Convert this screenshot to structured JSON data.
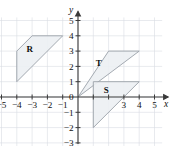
{
  "figure": {
    "type": "coordinate-plane",
    "axis_labels": {
      "x": "x",
      "y": "y"
    },
    "origin_label": "0"
  },
  "chart_data": {
    "type": "scatter",
    "title": "",
    "xlabel": "x",
    "ylabel": "y",
    "xlim": [
      -5.6,
      5.6
    ],
    "ylim": [
      -3.4,
      5.4
    ],
    "grid": true,
    "legend": "none",
    "x_ticks": [
      -5,
      -4,
      -3,
      -2,
      -1,
      0,
      1,
      2,
      3,
      4,
      5
    ],
    "y_ticks": [
      -3,
      -2,
      -1,
      0,
      1,
      2,
      3,
      4,
      5
    ],
    "x_tick_labels": [
      "−5",
      "−4",
      "−3",
      "−2",
      "−1",
      "0",
      "",
      "",
      "3",
      "4",
      "5"
    ],
    "y_tick_labels": [
      "−3",
      "−2",
      "−1",
      "0",
      "1",
      "2",
      "3",
      "4",
      "5"
    ],
    "shapes": [
      {
        "name": "R",
        "label": "R",
        "label_point": [
          -3.15,
          2.95
        ],
        "vertices": [
          [
            -4,
            1
          ],
          [
            -4,
            3
          ],
          [
            -3,
            4
          ],
          [
            -1,
            4
          ]
        ]
      },
      {
        "name": "T",
        "label": "T",
        "label_point": [
          1.35,
          2.05
        ],
        "vertices": [
          [
            0,
            0
          ],
          [
            2,
            3
          ],
          [
            4,
            3
          ]
        ]
      },
      {
        "name": "S",
        "label": "S",
        "label_point": [
          1.85,
          0.25
        ],
        "vertices": [
          [
            1,
            -2
          ],
          [
            1,
            1
          ],
          [
            4,
            1
          ]
        ]
      }
    ]
  },
  "tick_labels_x": [
    {
      "value": -5,
      "text": "−5"
    },
    {
      "value": -4,
      "text": "−4"
    },
    {
      "value": -3,
      "text": "−3"
    },
    {
      "value": -2,
      "text": "−2"
    },
    {
      "value": -1,
      "text": "−1"
    },
    {
      "value": 3,
      "text": "3"
    },
    {
      "value": 4,
      "text": "4"
    },
    {
      "value": 5,
      "text": "5"
    }
  ],
  "tick_labels_y": [
    {
      "value": 5,
      "text": "5"
    },
    {
      "value": 4,
      "text": "4"
    },
    {
      "value": 3,
      "text": "3"
    },
    {
      "value": 2,
      "text": "2"
    },
    {
      "value": 1,
      "text": "1"
    },
    {
      "value": -1,
      "text": "−1"
    },
    {
      "value": -2,
      "text": "−2"
    },
    {
      "value": -3,
      "text": "−3"
    }
  ]
}
